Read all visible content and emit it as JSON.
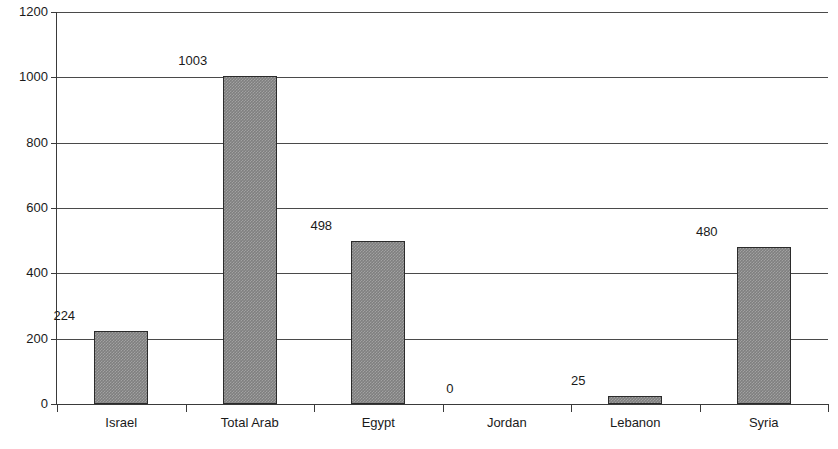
{
  "chart_data": {
    "type": "bar",
    "title": "",
    "subtitle": "",
    "xlabel": "",
    "ylabel": "",
    "categories": [
      "Israel",
      "Total Arab",
      "Egypt",
      "Jordan",
      "Lebanon",
      "Syria"
    ],
    "values": [
      224,
      1003,
      498,
      0,
      25,
      480
    ],
    "value_labels": [
      "224",
      "1003",
      "498",
      "0",
      "25",
      "480"
    ],
    "ylim": [
      0,
      1200
    ],
    "ytick_values": [
      0,
      200,
      400,
      600,
      800,
      1000,
      1200
    ],
    "ytick_labels": [
      "0",
      "200",
      "400",
      "600",
      "800",
      "1000",
      "1200"
    ],
    "grid": "horizontal",
    "legend": "none",
    "bar_color": "#7f7f7f",
    "bar_edge_color": "#2b2b2b",
    "axis_color": "#3a3a3a",
    "grid_color": "#4a4a4a",
    "background_color": "#ffffff",
    "text_color": "#1a1a1a"
  }
}
